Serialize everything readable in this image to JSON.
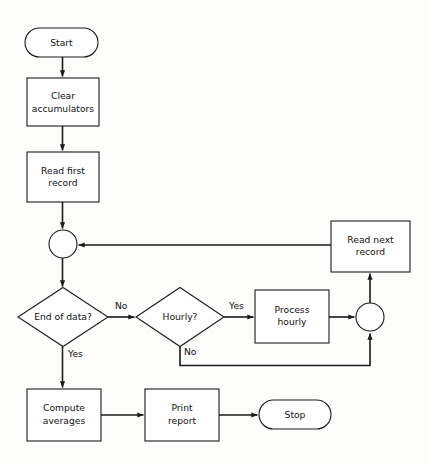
{
  "diagram": {
    "type": "flowchart",
    "background_color": "#fdfdfc",
    "line_color": "#1a1a1a",
    "shape_fill": "#ffffff",
    "nodes": [
      {
        "id": "start",
        "shape": "terminator",
        "label": "Start",
        "label_lines": [
          "Start"
        ],
        "x": 25,
        "y": 28,
        "w": 73,
        "h": 29
      },
      {
        "id": "clear-accumulators",
        "shape": "process",
        "label": "Clear accumulators",
        "label_lines": [
          "Clear",
          "accumulators"
        ],
        "x": 27,
        "y": 78,
        "w": 72,
        "h": 48
      },
      {
        "id": "read-first-record",
        "shape": "process",
        "label": "Read first record",
        "label_lines": [
          "Read first",
          "record"
        ],
        "x": 27,
        "y": 152,
        "w": 72,
        "h": 50
      },
      {
        "id": "left-connector",
        "shape": "connector",
        "label": "",
        "label_lines": [],
        "cx": 63,
        "cy": 244,
        "r": 14
      },
      {
        "id": "end-of-data",
        "shape": "decision",
        "label": "End of data?",
        "label_lines": [
          "End of data?"
        ],
        "cx": 63,
        "cy": 317,
        "w": 90,
        "h": 59
      },
      {
        "id": "hourly",
        "shape": "decision",
        "label": "Hourly?",
        "label_lines": [
          "Hourly?"
        ],
        "cx": 180,
        "cy": 317,
        "w": 88,
        "h": 59
      },
      {
        "id": "process-hourly",
        "shape": "process",
        "label": "Process hourly",
        "label_lines": [
          "Process",
          "hourly"
        ],
        "x": 255,
        "y": 290,
        "w": 74,
        "h": 53
      },
      {
        "id": "right-connector",
        "shape": "connector",
        "label": "",
        "label_lines": [],
        "cx": 370,
        "cy": 317,
        "r": 14
      },
      {
        "id": "read-next-record",
        "shape": "process",
        "label": "Read next record",
        "label_lines": [
          "Read next",
          "record"
        ],
        "x": 331,
        "y": 221,
        "w": 79,
        "h": 51
      },
      {
        "id": "compute-averages",
        "shape": "process",
        "label": "Compute averages",
        "label_lines": [
          "Compute",
          "averages"
        ],
        "x": 27,
        "y": 389,
        "w": 74,
        "h": 52
      },
      {
        "id": "print-report",
        "shape": "process",
        "label": "Print report",
        "label_lines": [
          "Print",
          "report"
        ],
        "x": 145,
        "y": 389,
        "w": 74,
        "h": 52
      },
      {
        "id": "stop",
        "shape": "terminator",
        "label": "Stop",
        "label_lines": [
          "Stop"
        ],
        "x": 259,
        "y": 400,
        "w": 72,
        "h": 29
      }
    ],
    "edges": [
      {
        "id": "start-to-clear",
        "from": "start",
        "to": "clear-accumulators",
        "label": ""
      },
      {
        "id": "clear-to-read-first",
        "from": "clear-accumulators",
        "to": "read-first-record",
        "label": ""
      },
      {
        "id": "read-first-to-connector",
        "from": "read-first-record",
        "to": "left-connector",
        "label": ""
      },
      {
        "id": "connector-to-end-of-data",
        "from": "left-connector",
        "to": "end-of-data",
        "label": ""
      },
      {
        "id": "end-of-data-no",
        "from": "end-of-data",
        "to": "hourly",
        "label": "No"
      },
      {
        "id": "end-of-data-yes",
        "from": "end-of-data",
        "to": "compute-averages",
        "label": "Yes"
      },
      {
        "id": "hourly-yes",
        "from": "hourly",
        "to": "process-hourly",
        "label": "Yes"
      },
      {
        "id": "hourly-no",
        "from": "hourly",
        "to": "right-connector",
        "label": "No"
      },
      {
        "id": "process-hourly-to-connector",
        "from": "process-hourly",
        "to": "right-connector",
        "label": ""
      },
      {
        "id": "connector-to-read-next",
        "from": "right-connector",
        "to": "read-next-record",
        "label": ""
      },
      {
        "id": "read-next-to-left-connector",
        "from": "read-next-record",
        "to": "left-connector",
        "label": ""
      },
      {
        "id": "compute-to-print",
        "from": "compute-averages",
        "to": "print-report",
        "label": ""
      },
      {
        "id": "print-to-stop",
        "from": "print-report",
        "to": "stop",
        "label": ""
      }
    ],
    "branch_labels": [
      {
        "id": "label-no-end-of-data",
        "text": "No",
        "x": 115,
        "y": 306
      },
      {
        "id": "label-yes-end-of-data",
        "text": "Yes",
        "x": 68,
        "y": 354
      },
      {
        "id": "label-yes-hourly",
        "text": "Yes",
        "x": 229,
        "y": 306
      },
      {
        "id": "label-no-hourly",
        "text": "No",
        "x": 184,
        "y": 352
      }
    ]
  }
}
